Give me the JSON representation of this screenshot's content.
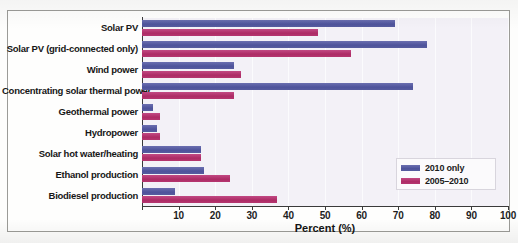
{
  "chart_data": {
    "type": "bar",
    "orientation": "horizontal",
    "title": "",
    "xlabel": "Percent (%)",
    "ylabel": "",
    "xlim": [
      0,
      100
    ],
    "xticks": [
      0,
      10,
      20,
      30,
      40,
      50,
      60,
      70,
      80,
      90,
      100
    ],
    "xticklabels": [
      "",
      "10",
      "20",
      "30",
      "40",
      "50",
      "60",
      "70",
      "80",
      "90",
      "100"
    ],
    "grid": true,
    "legend_position": "center right",
    "categories": [
      "Solar PV",
      "Solar PV (grid-connected only)",
      "Wind power",
      "Concentrating solar thermal power",
      "Geothermal power",
      "Hydropower",
      "Solar hot water/heating",
      "Ethanol production",
      "Biodiesel production"
    ],
    "series": [
      {
        "name": "2010 only",
        "color": "#535899",
        "values": [
          69,
          78,
          25,
          74,
          3,
          4,
          16,
          17,
          9
        ]
      },
      {
        "name": "2005–2010",
        "color": "#b33570",
        "values": [
          48,
          57,
          27,
          25,
          5,
          5,
          16,
          24,
          37
        ]
      }
    ]
  },
  "legend": {
    "items": [
      {
        "label": "2010 only",
        "color": "#535899"
      },
      {
        "label": "2005–2010",
        "color": "#b33570"
      }
    ]
  }
}
